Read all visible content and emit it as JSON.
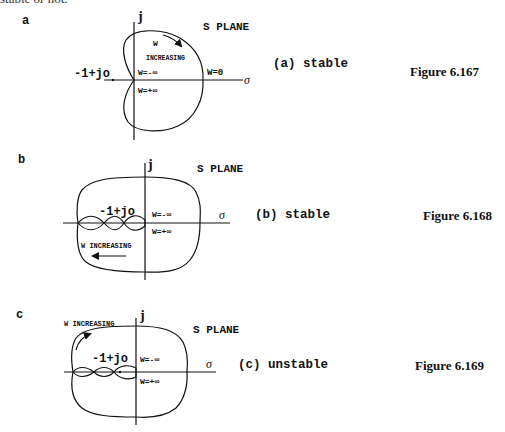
{
  "page": {
    "top_text": "stable or not."
  },
  "figures": [
    {
      "letter": "a",
      "plane_label": "S PLANE",
      "axis_j": "j",
      "axis_sigma": "σ",
      "critical_point": "-1+jo",
      "w_increasing_line1": "W",
      "w_increasing_line2": "INCREASING",
      "w_neg_inf": "W=-∞",
      "w_pos_inf": "W=+∞",
      "w_zero": "W=0",
      "caption": "(a) stable",
      "figure_number": "Figure 6.167"
    },
    {
      "letter": "b",
      "plane_label": "S PLANE",
      "axis_j": "j",
      "axis_sigma": "σ",
      "critical_point": "-1+jo",
      "w_increasing": "W INCREASING",
      "w_neg_inf": "W=-∞",
      "w_pos_inf": "W=+∞",
      "caption": "(b) stable",
      "figure_number": "Figure 6.168"
    },
    {
      "letter": "c",
      "plane_label": "S PLANE",
      "axis_j": "j",
      "axis_sigma": "σ",
      "critical_point": "-1+jo",
      "w_increasing": "W INCREASING",
      "w_neg_inf": "W=-∞",
      "w_pos_inf": "W=+∞",
      "caption": "(c) unstable",
      "figure_number": "Figure 6.169"
    }
  ]
}
